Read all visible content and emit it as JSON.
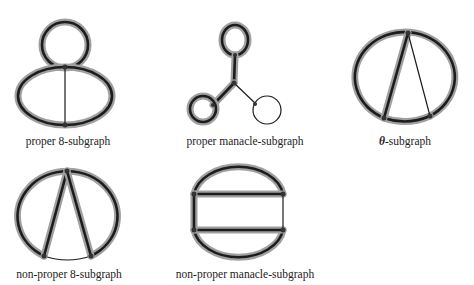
{
  "figures": [
    {
      "id": "proper-8",
      "label": "proper 8-subgraph"
    },
    {
      "id": "proper-manacle",
      "label": "proper manacle-subgraph"
    },
    {
      "id": "theta",
      "label_symbol": "θ",
      "label": "-subgraph"
    },
    {
      "id": "non-proper-8",
      "label": "non-proper 8-subgraph"
    },
    {
      "id": "non-proper-manacle",
      "label": "non-proper manacle-subgraph"
    }
  ],
  "colors": {
    "thick_halo": "#9a9a9a",
    "stroke": "#1a1a1a"
  }
}
